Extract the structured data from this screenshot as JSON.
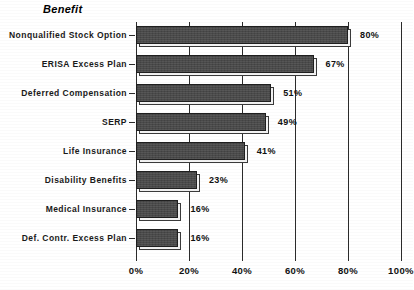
{
  "chart_data": {
    "type": "bar",
    "orientation": "horizontal",
    "title": "Benefit",
    "xlabel": "",
    "ylabel": "",
    "xlim": [
      0,
      100
    ],
    "grid": true,
    "grid_axis": "x",
    "legend": null,
    "bar_color": "#4a4a4a",
    "axis_color": "#2b2b2b",
    "categories": [
      "Nonqualified Stock Option",
      "ERISA Excess Plan",
      "Deferred Compensation",
      "SERP",
      "Life Insurance",
      "Disability Benefits",
      "Medical Insurance",
      "Def. Contr. Excess Plan"
    ],
    "values": [
      80,
      67,
      51,
      49,
      41,
      23,
      16,
      16
    ],
    "data_labels": [
      "80%",
      "67%",
      "51%",
      "49%",
      "41%",
      "23%",
      "16%",
      "16%"
    ],
    "xticks": [
      0,
      20,
      40,
      60,
      80,
      100
    ],
    "xtick_labels": [
      "0%",
      "20%",
      "40%",
      "60%",
      "80%",
      "100%"
    ]
  }
}
